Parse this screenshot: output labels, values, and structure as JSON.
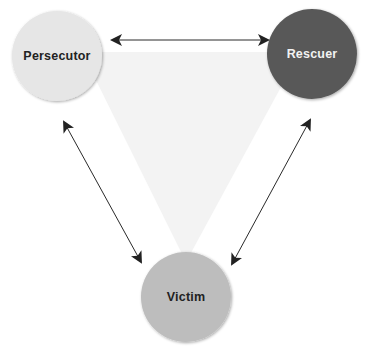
{
  "diagram": {
    "nodes": [
      {
        "id": "persecutor",
        "label": "Persecutor",
        "cx": 57,
        "cy": 56,
        "r": 45,
        "fill": "#e6e6e6",
        "text_color": "#222222"
      },
      {
        "id": "rescuer",
        "label": "Rescuer",
        "cx": 312,
        "cy": 54,
        "r": 45,
        "fill": "#595959",
        "text_color": "#f2f2f2"
      },
      {
        "id": "victim",
        "label": "Victim",
        "cx": 186,
        "cy": 297,
        "r": 45,
        "fill": "#bdbdbd",
        "text_color": "#222222"
      }
    ],
    "edges": [
      {
        "from": "persecutor",
        "to": "rescuer",
        "bidirectional": true,
        "x1": 112,
        "y1": 40,
        "x2": 268,
        "y2": 40
      },
      {
        "from": "persecutor",
        "to": "victim",
        "bidirectional": true,
        "x1": 64,
        "y1": 122,
        "x2": 141,
        "y2": 262
      },
      {
        "from": "rescuer",
        "to": "victim",
        "bidirectional": true,
        "x1": 310,
        "y1": 120,
        "x2": 232,
        "y2": 264
      }
    ],
    "background_triangle": {
      "fill": "#f3f3f3",
      "points": "82,52 300,52 186,262"
    },
    "colors": {
      "arrow": "#2a2a2a",
      "background": "#ffffff"
    }
  }
}
